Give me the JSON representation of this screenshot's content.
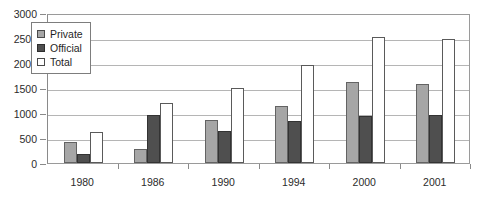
{
  "chart_data": {
    "type": "bar",
    "title": "",
    "subtitle": "",
    "xlabel": "",
    "ylabel": "",
    "categories": [
      "1980",
      "1986",
      "1990",
      "1994",
      "2000",
      "2001"
    ],
    "series": [
      {
        "name": "Private",
        "color": "#a6a6a6",
        "values": [
          420,
          280,
          860,
          1140,
          1620,
          1590
        ]
      },
      {
        "name": "Official",
        "color": "#4f4f4f",
        "values": [
          180,
          960,
          640,
          850,
          950,
          960
        ]
      },
      {
        "name": "Total",
        "color": "#ffffff",
        "values": [
          620,
          1210,
          1500,
          1960,
          2530,
          2490
        ]
      }
    ],
    "ylim": [
      0,
      3000
    ],
    "ytick_step": 500,
    "yticks": [
      0,
      500,
      1000,
      1500,
      2000,
      2500,
      3000
    ],
    "ytick_labels": [
      "0",
      "500",
      "1000",
      "1500",
      "2000",
      "2500",
      "3000"
    ],
    "grid": true,
    "grid_axis": "y",
    "legend_position": "upper-left-inside",
    "legend_entries": [
      "Private",
      "Official",
      "Total"
    ],
    "annotations": []
  },
  "colors": {
    "private": "#a6a6a6",
    "official": "#4f4f4f",
    "total": "#ffffff",
    "axis": "#8a8a8a",
    "grid": "#b5b5b5",
    "text": "#2b2b2b",
    "background": "#ffffff"
  }
}
